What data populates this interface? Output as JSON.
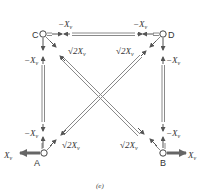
{
  "figure": {
    "caption": "(e)",
    "nodes": [
      {
        "id": "C",
        "label": "C",
        "x": 43,
        "y": 34
      },
      {
        "id": "D",
        "label": "D",
        "x": 163,
        "y": 34
      },
      {
        "id": "A",
        "label": "A",
        "x": 44,
        "y": 153
      },
      {
        "id": "B",
        "label": "B",
        "x": 163,
        "y": 153
      }
    ],
    "members": [
      {
        "from": "C",
        "to": "D",
        "force": "-X_v"
      },
      {
        "from": "C",
        "to": "A",
        "force": "-X_v"
      },
      {
        "from": "D",
        "to": "B",
        "force": "-X_v"
      },
      {
        "from": "A",
        "to": "D",
        "force": "√2 X_v"
      },
      {
        "from": "C",
        "to": "B",
        "force": "√2 X_v"
      }
    ],
    "external_loads": [
      {
        "node": "A",
        "label": "X_v",
        "direction": "left"
      },
      {
        "node": "B",
        "label": "X_v",
        "direction": "right"
      }
    ],
    "labels": {
      "neg_xv": "−X",
      "sub_v": "v",
      "sqrt2": "√2",
      "x": "X",
      "node_c": "C",
      "node_d": "D",
      "node_a": "A",
      "node_b": "B"
    },
    "colors": {
      "member": "#8a8a8a",
      "arrow": "#555555",
      "load_arrow": "#666666",
      "text": "#333333"
    }
  }
}
